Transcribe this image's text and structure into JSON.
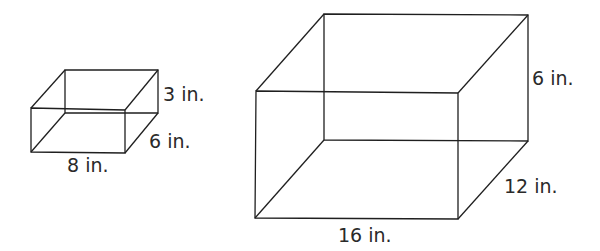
{
  "diagram": {
    "type": "rectangular-prisms",
    "line_color": "#1f1f1f",
    "prisms": [
      {
        "name": "small-prism",
        "labels": {
          "height": "3 in.",
          "depth": "6 in.",
          "width": "8 in."
        }
      },
      {
        "name": "large-prism",
        "labels": {
          "height": "6 in.",
          "depth": "12 in.",
          "width": "16 in."
        }
      }
    ]
  }
}
